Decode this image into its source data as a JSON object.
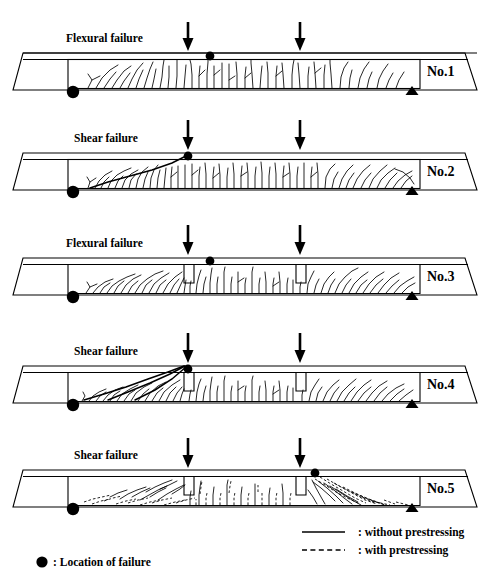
{
  "figure": {
    "type": "diagram",
    "background_color": "#ffffff",
    "line_color": "#000000"
  },
  "beams": [
    {
      "id": "no1",
      "label": "No.1",
      "failure_mode": "Flexural failure",
      "notches": 0,
      "failure_dot_x": 210,
      "crack_style": "without prestressing",
      "description": "Dense vertical flexural cracks through mid-span, inclined near left support"
    },
    {
      "id": "no2",
      "label": "No.2",
      "failure_mode": "Shear failure",
      "notches": 0,
      "failure_dot_x": 188,
      "crack_style": "without prestressing",
      "description": "Shear crack running from left support up to left load point, plus dense flexural cracks"
    },
    {
      "id": "no3",
      "label": "No.3",
      "failure_mode": "Flexural failure",
      "notches": 2,
      "failure_dot_x": 210,
      "crack_style": "without prestressing",
      "description": "Two top notches; inclined flexural-shear cracks fanning from both notches"
    },
    {
      "id": "no4",
      "label": "No.4",
      "failure_mode": "Shear failure",
      "notches": 2,
      "failure_dot_x": 188,
      "crack_style": "without prestressing",
      "description": "Two top notches; dominant shear crack from left support to left notch / load point"
    },
    {
      "id": "no5",
      "label": "No.5",
      "failure_mode": "Shear failure",
      "notches": 2,
      "failure_dot_x": 315,
      "crack_style": "mixed solid and dashed",
      "description": "Two top notches; mixture of prestressed (dashed) and non-prestressed (solid) cracks, failure at right load point"
    }
  ],
  "legend": {
    "line_solid_label": ": without  prestressing",
    "line_dashed_label": ": with prestressing",
    "failure_marker_label": ": Location of failure"
  },
  "markers": {
    "left_support": "pin-support-circle",
    "right_support": "roller-support-triangle",
    "load_arrow": "downward-load-arrow",
    "failure_point": "filled-circle"
  },
  "load_points": {
    "left_arrow_x": 188,
    "right_arrow_x": 300
  }
}
